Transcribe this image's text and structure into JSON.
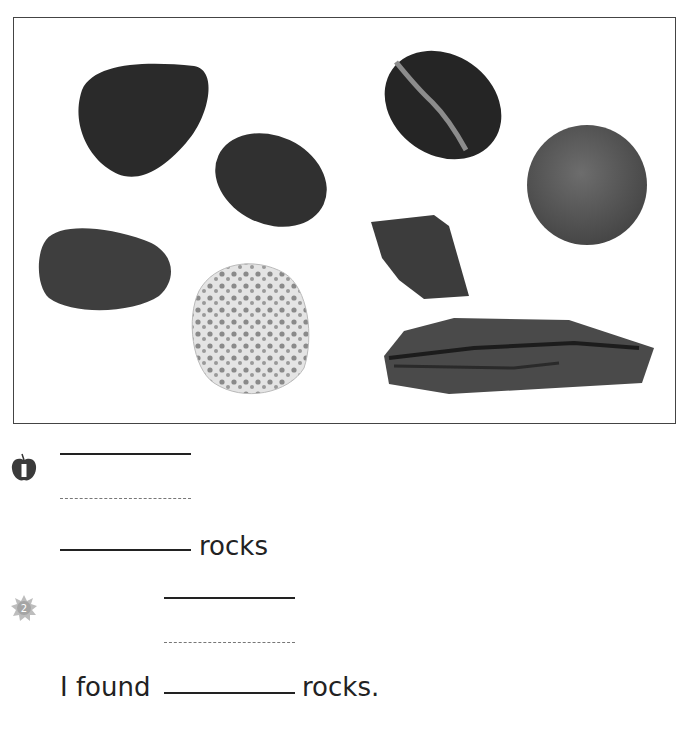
{
  "photo": {
    "description": "Collection of eight rocks",
    "rocks": [
      {
        "name": "dark-triangular-pebble"
      },
      {
        "name": "dark-oval-pebble"
      },
      {
        "name": "striped-black-pebble"
      },
      {
        "name": "round-gray-stone"
      },
      {
        "name": "speckled-oval-stone"
      },
      {
        "name": "porous-white-rock"
      },
      {
        "name": "flat-angular-rock"
      },
      {
        "name": "layered-slate-rock"
      }
    ]
  },
  "problems": [
    {
      "number": "1",
      "icon": "apple-icon",
      "answer_label": "rocks"
    },
    {
      "number": "2",
      "icon": "sun-icon",
      "sentence_prefix": "I found",
      "sentence_suffix": "rocks."
    }
  ],
  "colors": {
    "frame_border": "#444444",
    "rock_dark": "#2b2b2b",
    "text": "#222222",
    "dashed_line": "#777777"
  }
}
